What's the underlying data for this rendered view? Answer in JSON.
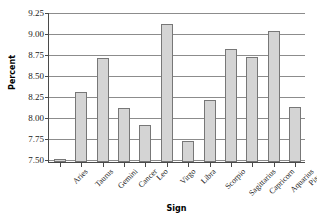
{
  "chart_data": {
    "type": "bar",
    "title": "",
    "xlabel": "Sign",
    "ylabel": "Percent",
    "categories": [
      "Aries",
      "Taurus",
      "Gemini",
      "Cancer",
      "Leo",
      "Virgo",
      "Libra",
      "Scorpio",
      "Sagittarius",
      "Capricorn",
      "Aquarius",
      "Pisces"
    ],
    "values": [
      7.5,
      8.3,
      8.71,
      8.11,
      7.91,
      9.11,
      7.72,
      8.21,
      8.81,
      8.72,
      9.02,
      8.12
    ],
    "ylim": [
      7.47,
      9.25
    ],
    "yticks": [
      7.5,
      7.75,
      8.0,
      8.25,
      8.5,
      8.75,
      9.0,
      9.25
    ],
    "ytick_labels": [
      "7.50",
      "7.75",
      "8.00",
      "8.25",
      "8.50",
      "8.75",
      "9.00",
      "9.25"
    ],
    "grid": true,
    "legend": false,
    "bar_color": "#d4d4d4",
    "bar_edge_color": "#777777",
    "axis_color": "#4a4a4a",
    "grid_color": "#8c8c8c"
  }
}
